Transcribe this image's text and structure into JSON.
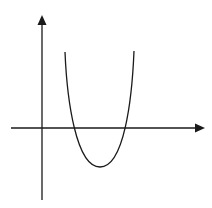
{
  "diagram": {
    "type": "function-graph",
    "colors": {
      "background": "#ffffff",
      "stroke": "#1a1a1a"
    },
    "axes": {
      "x_axis": {
        "from": [
          11,
          128
        ],
        "to": [
          205,
          128
        ],
        "arrow": "right"
      },
      "y_axis": {
        "from": [
          42,
          200
        ],
        "to": [
          42,
          15
        ],
        "arrow": "up"
      }
    },
    "curve": {
      "kind": "parabola",
      "opens": "up",
      "left_end": [
        65,
        52
      ],
      "right_end": [
        134,
        51
      ],
      "roots_px": [
        73,
        125
      ],
      "vertex_px": [
        100,
        167
      ]
    },
    "labels": []
  }
}
